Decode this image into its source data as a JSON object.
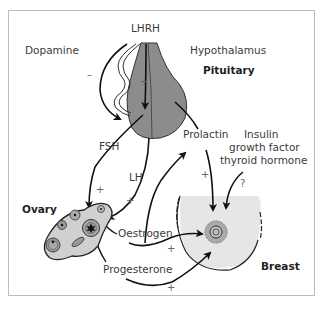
{
  "diagram": {
    "labels": {
      "lhrh": "LHRH",
      "dopamine": "Dopamine",
      "hypothalamus": "Hypothalamus",
      "pituitary": "Pituitary",
      "fsh": "FSH",
      "lh": "LH",
      "prolactin": "Prolactin",
      "insulin_line1": "Insulin",
      "insulin_line2": "growth factor",
      "insulin_line3": "thyroid hormone",
      "ovary": "Ovary",
      "oestrogen": "Oestrogen",
      "progesterone": "Progesterone",
      "breast": "Breast"
    },
    "signs": {
      "dopamine_effect": "–",
      "lhrh_effect": "+",
      "fsh_effect": "+",
      "lh_effect": "+",
      "oestrogen_to_pituitary": "+",
      "prolactin_to_breast": "+",
      "unknown_effect": "?",
      "oestrogen_to_breast": "+",
      "progesterone_to_breast": "+"
    },
    "colors": {
      "pituitary_fill": "#8c8c8c",
      "ovary_fill": "#d0d0d0",
      "breast_fill": "#e6e6e6",
      "arrow": "#111111",
      "frame": "#bdbdbd"
    }
  }
}
